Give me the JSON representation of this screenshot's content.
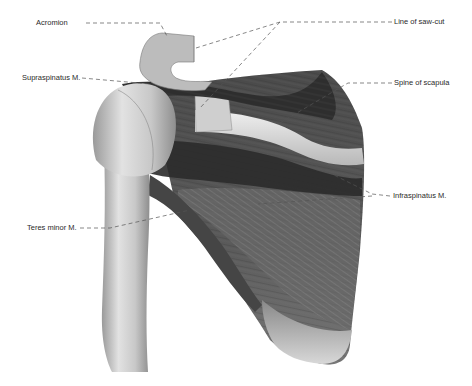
{
  "figure": {
    "labels": [
      {
        "id": "acromion",
        "text": "Acromion",
        "x": 36,
        "y": 21
      },
      {
        "id": "saw-cut",
        "text": "Line of saw-cut",
        "x": 394,
        "y": 20
      },
      {
        "id": "supraspinatus",
        "text": "Supraspinatus M.",
        "x": 22,
        "y": 76
      },
      {
        "id": "spine",
        "text": "Spine of scapula",
        "x": 394,
        "y": 80
      },
      {
        "id": "infraspinatus",
        "text": "Infraspinatus M.",
        "x": 393,
        "y": 194
      },
      {
        "id": "teres-minor",
        "text": "Teres minor M.",
        "x": 27,
        "y": 224
      }
    ],
    "colors": {
      "background": "#ffffff",
      "bone_light": "#d9d9d9",
      "bone_mid": "#b5b5b5",
      "muscle_dark": "#3a3a3a",
      "muscle_mid": "#5e5e5e",
      "leader_line": "#555555",
      "label_text": "#2a2a2a"
    }
  }
}
